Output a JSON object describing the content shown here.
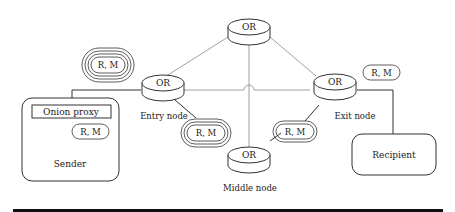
{
  "diagram": {
    "nodes": {
      "top": {
        "label": "OR",
        "caption": ""
      },
      "entry": {
        "label": "OR",
        "caption": "Entry node"
      },
      "middle": {
        "label": "OR",
        "caption": "Middle node"
      },
      "exit": {
        "label": "OR",
        "caption": "Exit node"
      }
    },
    "sender": {
      "title": "Sender",
      "proxy_label": "Onion proxy",
      "message": "R, M"
    },
    "recipient": {
      "title": "Recipient"
    },
    "messages": {
      "three_layer": "R, M",
      "two_layer": "R, M",
      "one_layer": "R, M",
      "plain": "R, M"
    }
  }
}
